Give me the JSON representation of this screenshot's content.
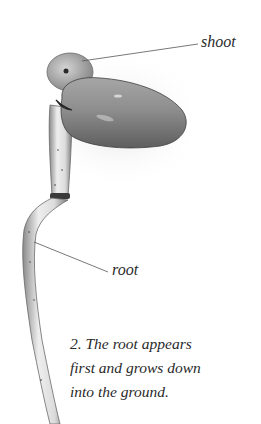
{
  "labels": {
    "shoot": "shoot",
    "root": "root"
  },
  "caption": {
    "lines": [
      "2. The root appears",
      "first and grows down",
      "into the ground."
    ]
  },
  "colors": {
    "background": "#ffffff",
    "text": "#2a2a2a",
    "seed_fill": "#8a8a8a",
    "root_fill": "#d8d8d8",
    "leader_line": "#555555"
  }
}
